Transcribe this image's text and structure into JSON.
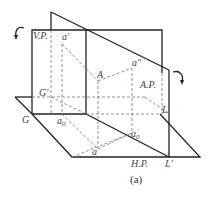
{
  "diagram": {
    "caption": "(a)",
    "planes": {
      "vertical": "V.P.",
      "auxiliary": "A.P.",
      "horizontal": "H.P."
    },
    "points": {
      "A": "A",
      "a_prime": "a′",
      "a_double_prime": "a″",
      "a": "a",
      "a0": "a",
      "a0_sub": "0",
      "a0_prime": "a",
      "a0_prime_sub": "0",
      "a0_prime_sup": "′",
      "G": "G",
      "G_prime": "G′",
      "L": "L",
      "L_prime": "L′"
    },
    "colors": {
      "solid_line": "#222222",
      "dashed_line": "#777777",
      "label": "#444444"
    }
  }
}
